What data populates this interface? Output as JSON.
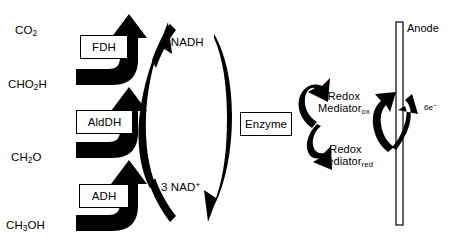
{
  "diagram": {
    "background_color": "#ffffff",
    "ink_color": "#000000"
  },
  "substrates": [
    {
      "name": "carbon-dioxide",
      "base": "CO",
      "sub": "2",
      "tail": ""
    },
    {
      "name": "formic-acid",
      "base": "CHO",
      "sub": "2",
      "tail": "H"
    },
    {
      "name": "formaldehyde",
      "base": "CH",
      "sub": "2",
      "tail": "O"
    },
    {
      "name": "methanol",
      "base": "CH",
      "sub": "3",
      "tail": "OH"
    }
  ],
  "enzymes": [
    {
      "name": "formate-dehydrogenase",
      "label": "FDH"
    },
    {
      "name": "aldehyde-dehydrogenase",
      "label": "AldDH"
    },
    {
      "name": "alcohol-dehydrogenase",
      "label": "ADH"
    }
  ],
  "cofactors": {
    "oxidized_form": {
      "count": "3",
      "base": "NAD",
      "charge": "+"
    },
    "reduced_form": {
      "count": "3",
      "base": "NADH",
      "charge": ""
    },
    "reduced_label": "3 NADH",
    "oxidized_label": "3 NAD"
  },
  "enzyme_linker": {
    "label": "Enzyme"
  },
  "mediator": {
    "oxidized": {
      "line1": "Redox",
      "line2": "Mediator",
      "state": "ox"
    },
    "reduced": {
      "line1": "Redox",
      "line2": "Mediator",
      "state": "red"
    }
  },
  "electrode": {
    "label": "Anode"
  },
  "electrons": {
    "count": "6e",
    "charge": "−"
  }
}
